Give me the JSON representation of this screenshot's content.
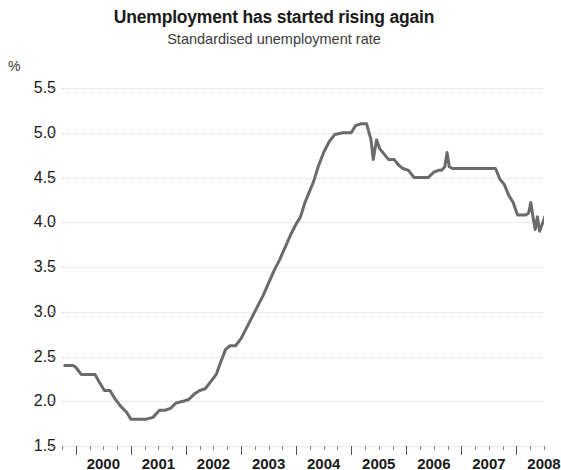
{
  "chart_data": {
    "type": "line",
    "title": "Unemployment has started rising again",
    "subtitle": "Standardised unemployment rate",
    "ylabel": "%",
    "xlabel": "",
    "ylim": [
      1.5,
      5.5
    ],
    "ytick_labels": [
      "5.5",
      "5.0",
      "4.5",
      "4.0",
      "3.5",
      "3.0",
      "2.5",
      "2.0",
      "1.5"
    ],
    "ytick_values": [
      5.5,
      5.0,
      4.5,
      4.0,
      3.5,
      3.0,
      2.5,
      2.0,
      1.5
    ],
    "xtick_labels": [
      "2000",
      "2001",
      "2002",
      "2003",
      "2004",
      "2005",
      "2006",
      "2007",
      "2008"
    ],
    "xlim": [
      1999.75,
      2008.5
    ],
    "grid": "horizontal-dotted",
    "legend": "none",
    "line_color": "#6b6b6b",
    "line_width": 3,
    "series": [
      {
        "name": "Standardised unemployment rate",
        "x": [
          1999.75,
          2000.0,
          2000.25,
          2000.5,
          2000.75,
          2001.0,
          2001.25,
          2001.5,
          2001.75,
          2002.0,
          2002.25,
          2002.5,
          2002.75,
          2003.0,
          2003.25,
          2003.5,
          2003.75,
          2004.0,
          2004.25,
          2004.5,
          2004.75,
          2005.0,
          2005.25,
          2005.5,
          2005.75,
          2006.0,
          2006.25,
          2006.5,
          2006.75,
          2007.0,
          2007.25,
          2007.5,
          2007.75,
          2008.0,
          2008.25,
          2008.5
        ],
        "values": [
          2.4,
          2.4,
          2.3,
          2.3,
          2.1,
          1.9,
          1.8,
          1.8,
          1.9,
          2.0,
          2.1,
          2.1,
          2.3,
          2.6,
          2.7,
          3.0,
          3.4,
          3.8,
          4.0,
          4.4,
          4.7,
          5.0,
          5.0,
          5.1,
          4.8,
          4.7,
          4.6,
          4.55,
          4.5,
          4.5,
          4.6,
          4.75,
          4.6,
          4.6,
          4.3,
          4.2
        ]
      }
    ],
    "annotations": [
      {
        "label": "trough",
        "x": 2000.6,
        "y": 1.8
      },
      {
        "label": "peak",
        "x": 2004.1,
        "y": 5.1
      },
      {
        "label": "final value",
        "x": 2008.4,
        "y": 4.2
      }
    ]
  },
  "series_points": [
    [
      1999.8,
      2.4
    ],
    [
      1999.95,
      2.4
    ],
    [
      2000.0,
      2.38
    ],
    [
      2000.1,
      2.3
    ],
    [
      2000.25,
      2.3
    ],
    [
      2000.35,
      2.3
    ],
    [
      2000.42,
      2.22
    ],
    [
      2000.52,
      2.12
    ],
    [
      2000.62,
      2.12
    ],
    [
      2000.72,
      2.02
    ],
    [
      2000.82,
      1.94
    ],
    [
      2000.92,
      1.88
    ],
    [
      2001.0,
      1.8
    ],
    [
      2001.15,
      1.8
    ],
    [
      2001.28,
      1.8
    ],
    [
      2001.4,
      1.82
    ],
    [
      2001.52,
      1.9
    ],
    [
      2001.62,
      1.9
    ],
    [
      2001.72,
      1.92
    ],
    [
      2001.82,
      1.98
    ],
    [
      2001.95,
      2.0
    ],
    [
      2002.05,
      2.02
    ],
    [
      2002.15,
      2.08
    ],
    [
      2002.25,
      2.12
    ],
    [
      2002.35,
      2.14
    ],
    [
      2002.45,
      2.22
    ],
    [
      2002.55,
      2.3
    ],
    [
      2002.62,
      2.42
    ],
    [
      2002.72,
      2.58
    ],
    [
      2002.8,
      2.62
    ],
    [
      2002.9,
      2.62
    ],
    [
      2003.0,
      2.7
    ],
    [
      2003.1,
      2.82
    ],
    [
      2003.2,
      2.94
    ],
    [
      2003.3,
      3.06
    ],
    [
      2003.4,
      3.18
    ],
    [
      2003.5,
      3.32
    ],
    [
      2003.6,
      3.46
    ],
    [
      2003.7,
      3.58
    ],
    [
      2003.8,
      3.72
    ],
    [
      2003.9,
      3.86
    ],
    [
      2004.0,
      3.98
    ],
    [
      2004.08,
      4.06
    ],
    [
      2004.16,
      4.22
    ],
    [
      2004.24,
      4.34
    ],
    [
      2004.32,
      4.46
    ],
    [
      2004.4,
      4.62
    ],
    [
      2004.5,
      4.78
    ],
    [
      2004.6,
      4.9
    ],
    [
      2004.7,
      4.98
    ],
    [
      2004.85,
      5.0
    ],
    [
      2005.0,
      5.0
    ],
    [
      2005.08,
      5.08
    ],
    [
      2005.18,
      5.1
    ],
    [
      2005.28,
      5.1
    ],
    [
      2005.36,
      4.92
    ],
    [
      2005.4,
      4.7
    ],
    [
      2005.46,
      4.92
    ],
    [
      2005.52,
      4.82
    ],
    [
      2005.6,
      4.76
    ],
    [
      2005.68,
      4.7
    ],
    [
      2005.78,
      4.7
    ],
    [
      2005.86,
      4.64
    ],
    [
      2005.94,
      4.6
    ],
    [
      2006.04,
      4.58
    ],
    [
      2006.14,
      4.5
    ],
    [
      2006.26,
      4.5
    ],
    [
      2006.4,
      4.5
    ],
    [
      2006.5,
      4.56
    ],
    [
      2006.58,
      4.58
    ],
    [
      2006.64,
      4.58
    ],
    [
      2006.7,
      4.62
    ],
    [
      2006.74,
      4.78
    ],
    [
      2006.78,
      4.62
    ],
    [
      2006.84,
      4.6
    ],
    [
      2006.94,
      4.6
    ],
    [
      2007.1,
      4.6
    ],
    [
      2007.3,
      4.6
    ],
    [
      2007.5,
      4.6
    ],
    [
      2007.62,
      4.6
    ],
    [
      2007.7,
      4.48
    ],
    [
      2007.78,
      4.42
    ],
    [
      2007.86,
      4.3
    ],
    [
      2007.94,
      4.22
    ],
    [
      2008.02,
      4.08
    ],
    [
      2008.1,
      4.08
    ],
    [
      2008.16,
      4.08
    ],
    [
      2008.22,
      4.1
    ],
    [
      2008.26,
      4.22
    ],
    [
      2008.3,
      4.06
    ],
    [
      2008.34,
      3.92
    ],
    [
      2008.38,
      4.06
    ],
    [
      2008.42,
      3.9
    ],
    [
      2008.48,
      4.0
    ],
    [
      2008.54,
      4.1
    ],
    [
      2008.6,
      4.12
    ],
    [
      2008.7,
      4.12
    ],
    [
      2008.78,
      4.2
    ],
    [
      2008.88,
      4.2
    ]
  ],
  "axes": {
    "y_unit_label": "%",
    "y_ticks": [
      "5.5",
      "5.0",
      "4.5",
      "4.0",
      "3.5",
      "3.0",
      "2.5",
      "2.0",
      "1.5"
    ],
    "x_ticks": [
      "2000",
      "2001",
      "2002",
      "2003",
      "2004",
      "2005",
      "2006",
      "2007",
      "2008"
    ]
  },
  "header": {
    "title": "Unemployment has started rising again",
    "subtitle": "Standardised unemployment rate"
  }
}
